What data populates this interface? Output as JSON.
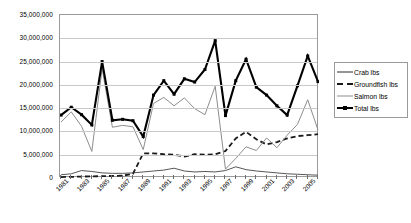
{
  "chart_data": {
    "type": "line",
    "title": "",
    "xlabel": "",
    "ylabel": "",
    "ylim": [
      0,
      35000000
    ],
    "ytick_labels": [
      "35,000,000",
      "30,000,000",
      "25,000,000",
      "20,000,000",
      "15,000,000",
      "10,000,000",
      "5,000,000",
      "0"
    ],
    "ytick_values": [
      35000000,
      30000000,
      25000000,
      20000000,
      15000000,
      10000000,
      5000000,
      0
    ],
    "grid": true,
    "legend_position": "right",
    "x": [
      1981,
      1982,
      1983,
      1984,
      1985,
      1986,
      1987,
      1988,
      1989,
      1990,
      1991,
      1992,
      1993,
      1994,
      1995,
      1996,
      1997,
      1998,
      1999,
      2000,
      2001,
      2002,
      2003,
      2004,
      2005,
      2006
    ],
    "xtick_labels": [
      "1981",
      "1983",
      "1985",
      "1987",
      "1989",
      "1991",
      "1993",
      "1995",
      "1997",
      "1999",
      "2001",
      "2003",
      "2005"
    ],
    "series": [
      {
        "name": "Crab lbs",
        "style": "thin-solid",
        "color": "#2b2b2b",
        "values": [
          700000,
          900000,
          1600000,
          1400000,
          1100000,
          1000000,
          1000000,
          1100000,
          1300000,
          1500000,
          1700000,
          2100000,
          1500000,
          1300000,
          1400000,
          1300000,
          1600000,
          2400000,
          1800000,
          1500000,
          1300000,
          1100000,
          900000,
          800000,
          700000,
          600000
        ]
      },
      {
        "name": "Groundfish lbs",
        "style": "dashed",
        "color": "#1a1a1a",
        "values": [
          200000,
          250000,
          300000,
          350000,
          400000,
          450000,
          500000,
          900000,
          5300000,
          5300000,
          5100000,
          5000000,
          4600000,
          5100000,
          5000000,
          5100000,
          5800000,
          8500000,
          9900000,
          8300000,
          7200000,
          7700000,
          8500000,
          9000000,
          9200000,
          9400000
        ]
      },
      {
        "name": "Salmon lbs",
        "style": "gray-solid",
        "color": "#8d8d8d",
        "values": [
          12000000,
          14200000,
          11100000,
          5700000,
          23500000,
          10900000,
          11300000,
          11000000,
          6100000,
          16000000,
          17300000,
          15500000,
          17200000,
          14900000,
          13600000,
          19700000,
          1900000,
          4200000,
          6700000,
          5900000,
          8600000,
          6500000,
          9200000,
          11500000,
          16800000,
          10300000
        ]
      },
      {
        "name": "Total lbs",
        "style": "thick-solid-marker",
        "color": "#000000",
        "values": [
          13500000,
          15200000,
          13600000,
          11400000,
          25000000,
          12400000,
          12600000,
          12300000,
          8900000,
          17800000,
          20900000,
          18000000,
          21300000,
          20600000,
          23300000,
          29500000,
          13400000,
          20900000,
          25500000,
          19500000,
          17800000,
          15500000,
          13500000,
          19800000,
          26200000,
          20700000
        ]
      }
    ]
  },
  "legend": {
    "items": [
      {
        "label": "Crab lbs"
      },
      {
        "label": "Groundfish lbs"
      },
      {
        "label": "Salmon lbs"
      },
      {
        "label": "Total lbs"
      }
    ]
  }
}
